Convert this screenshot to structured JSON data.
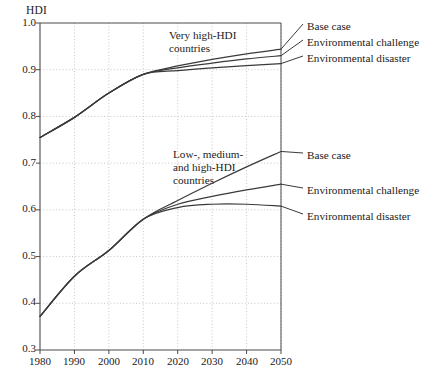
{
  "chart_data": {
    "type": "line",
    "title": "",
    "ylabel": "HDI",
    "xlabel": "",
    "xlim": [
      1980,
      2050
    ],
    "ylim": [
      0.3,
      1.0
    ],
    "grid": true,
    "legend_position": "right-of-plot (direct labels with leader lines)",
    "x": [
      1980,
      1990,
      2000,
      2010,
      2020,
      2030,
      2040,
      2050
    ],
    "xticks": [
      "1980",
      "1990",
      "2000",
      "2010",
      "2020",
      "2030",
      "2040",
      "2050"
    ],
    "yticks": [
      "0.3",
      "0.4",
      "0.5",
      "0.6",
      "0.7",
      "0.8",
      "0.9",
      "1.0"
    ],
    "groups": [
      {
        "name": "Very high-HDI countries",
        "annotation_lines": [
          "Very high-HDI",
          "countries"
        ],
        "series": [
          {
            "name": "Base case",
            "label": "Base case",
            "values": [
              0.755,
              0.798,
              0.85,
              0.89,
              0.908,
              0.922,
              0.934,
              0.944
            ]
          },
          {
            "name": "Environmental challenge",
            "label": "Environmental challenge",
            "values": [
              0.755,
              0.798,
              0.85,
              0.89,
              0.904,
              0.914,
              0.923,
              0.93
            ]
          },
          {
            "name": "Environmental disaster",
            "label": "Environmental disaster",
            "values": [
              0.755,
              0.798,
              0.85,
              0.89,
              0.898,
              0.904,
              0.909,
              0.913
            ]
          }
        ]
      },
      {
        "name": "Low-, medium- and high-HDI countries",
        "annotation_lines": [
          "Low-, medium-",
          "and high-HDI",
          "countries"
        ],
        "series": [
          {
            "name": "Base case",
            "label": "Base case",
            "values": [
              0.372,
              0.458,
              0.513,
              0.58,
              0.62,
              0.657,
              0.692,
              0.725
            ]
          },
          {
            "name": "Environmental challenge",
            "label": "Environmental challenge",
            "values": [
              0.372,
              0.458,
              0.513,
              0.58,
              0.612,
              0.629,
              0.643,
              0.655
            ]
          },
          {
            "name": "Environmental disaster",
            "label": "Environmental disaster",
            "values": [
              0.372,
              0.458,
              0.513,
              0.58,
              0.605,
              0.612,
              0.612,
              0.608
            ]
          }
        ]
      }
    ],
    "colors": {
      "line": "#3a3a3a",
      "axis": "#4a4a4a",
      "grid": "#b9b9b9",
      "text": "#1a1a1a"
    }
  },
  "axis": {
    "y_label": "HDI",
    "y_ticks": [
      "1.0",
      "0.9",
      "0.8",
      "0.7",
      "0.6",
      "0.5",
      "0.4",
      "0.3"
    ],
    "x_ticks": [
      "1980",
      "1990",
      "2000",
      "2010",
      "2020",
      "2030",
      "2040",
      "2050"
    ]
  },
  "annotations": {
    "upper_group": [
      "Very high-HDI",
      "countries"
    ],
    "lower_group": [
      "Low-, medium-",
      "and high-HDI",
      "countries"
    ]
  },
  "legend": {
    "upper": [
      "Base case",
      "Environmental challenge",
      "Environmental disaster"
    ],
    "lower": [
      "Base case",
      "Environmental challenge",
      "Environmental disaster"
    ]
  }
}
